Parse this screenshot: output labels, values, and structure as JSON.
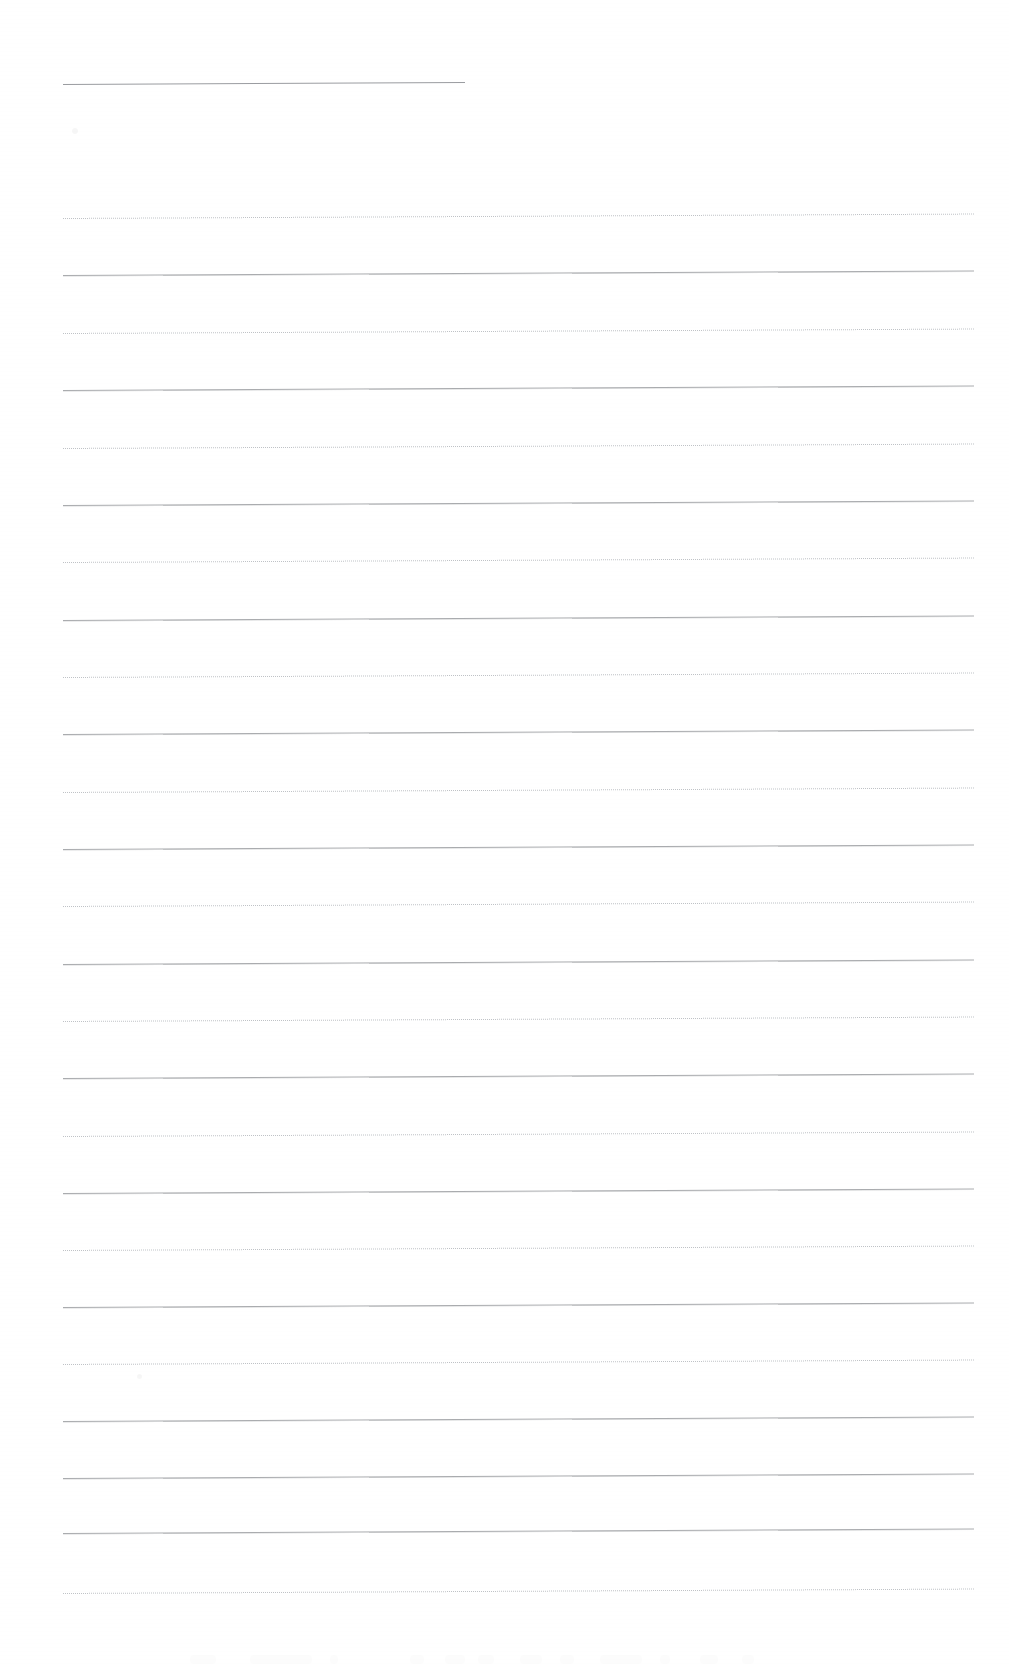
{
  "document": {
    "type": "scanned-ruled-paper",
    "title": "Blank ruled notebook page (scan)",
    "page_width": 1009,
    "page_height": 1664,
    "background_color": "#ffffff",
    "has_text": false,
    "visible_text": "",
    "orientation": "portrait"
  },
  "colors": {
    "paper": "#ffffff",
    "rule_solid": "#a9abae",
    "rule_dotted": "#bfc2c6",
    "rule_header": "#9a9ca0"
  },
  "ruling": {
    "style": "alternating solid and dotted horizontal rules",
    "left_margin_x": 63,
    "right_margin_x": 974,
    "line_spacing": 57.4,
    "skew_degrees": -0.28,
    "header_rule": {
      "label": "short header rule",
      "x": 63,
      "y": 84,
      "width": 402,
      "variant": "solid"
    },
    "lines": [
      {
        "y": 218,
        "variant": "dotted"
      },
      {
        "y": 275,
        "variant": "solid"
      },
      {
        "y": 333,
        "variant": "dotted"
      },
      {
        "y": 390,
        "variant": "solid"
      },
      {
        "y": 448,
        "variant": "dotted"
      },
      {
        "y": 505,
        "variant": "solid"
      },
      {
        "y": 562,
        "variant": "dotted"
      },
      {
        "y": 620,
        "variant": "solid"
      },
      {
        "y": 677,
        "variant": "dotted"
      },
      {
        "y": 734,
        "variant": "solid"
      },
      {
        "y": 792,
        "variant": "dotted"
      },
      {
        "y": 849,
        "variant": "solid"
      },
      {
        "y": 906,
        "variant": "dotted"
      },
      {
        "y": 964,
        "variant": "solid"
      },
      {
        "y": 1021,
        "variant": "dotted"
      },
      {
        "y": 1078,
        "variant": "solid"
      },
      {
        "y": 1136,
        "variant": "dotted"
      },
      {
        "y": 1193,
        "variant": "solid"
      },
      {
        "y": 1250,
        "variant": "dotted"
      },
      {
        "y": 1307,
        "variant": "solid"
      },
      {
        "y": 1364,
        "variant": "dotted"
      },
      {
        "y": 1421,
        "variant": "solid"
      },
      {
        "y": 1478,
        "variant": "solid"
      },
      {
        "y": 1533,
        "variant": "solid"
      },
      {
        "y": 1593,
        "variant": "dotted"
      }
    ]
  },
  "artifacts": {
    "description": "faint scanner smudges along the bottom edge",
    "bottom_smudges": [
      {
        "x": 190,
        "width": 26
      },
      {
        "x": 250,
        "width": 62
      },
      {
        "x": 330,
        "width": 8
      },
      {
        "x": 410,
        "width": 14
      },
      {
        "x": 445,
        "width": 20
      },
      {
        "x": 478,
        "width": 16
      },
      {
        "x": 520,
        "width": 22
      },
      {
        "x": 560,
        "width": 14
      },
      {
        "x": 600,
        "width": 42
      },
      {
        "x": 660,
        "width": 10
      },
      {
        "x": 700,
        "width": 18
      },
      {
        "x": 742,
        "width": 12
      }
    ],
    "faint_marks": [
      {
        "x": 72,
        "y": 128,
        "w": 6,
        "h": 6
      },
      {
        "x": 137,
        "y": 1374,
        "w": 5,
        "h": 5
      }
    ]
  }
}
